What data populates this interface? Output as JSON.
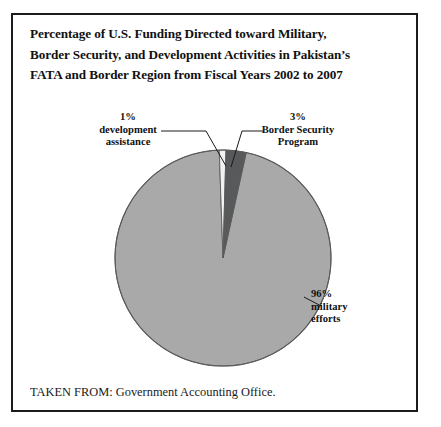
{
  "figure": {
    "title_lines": [
      "Percentage of U.S. Funding Directed toward Military,",
      "Border Security, and Development Activities in Pakistan’s",
      "FATA and Border Region from Fiscal Years 2002 to 2007"
    ],
    "caption": "TAKEN FROM: Government Accounting Office.",
    "frame_color": "#1c1c1c",
    "background": "#ffffff"
  },
  "labels": {
    "development": {
      "percent": "1%",
      "line1": "development",
      "line2": "assistance"
    },
    "border_security": {
      "percent": "3%",
      "line1": "Border Security",
      "line2": "Program"
    },
    "military": {
      "percent": "96%",
      "line1": "military",
      "line2": "efforts"
    }
  },
  "chart_data": {
    "type": "pie",
    "title": "Percentage of U.S. Funding Directed toward Military, Border Security, and Development Activities in Pakistan’s FATA and Border Region from Fiscal Years 2002 to 2007",
    "categories": [
      "development assistance",
      "Border Security Program",
      "military efforts"
    ],
    "values": [
      1,
      3,
      96
    ],
    "value_labels": [
      "1%",
      "3%",
      "96%"
    ],
    "colors": [
      "#f2f2f0",
      "#58595b",
      "#aaa9a9"
    ],
    "unit": "percent",
    "legend": "none",
    "start_angle_deg": -2,
    "direction": "clockwise",
    "center": {
      "x": 221,
      "y": 256
    },
    "radius": 108,
    "stroke": "#5a5a5a",
    "grid": false
  }
}
